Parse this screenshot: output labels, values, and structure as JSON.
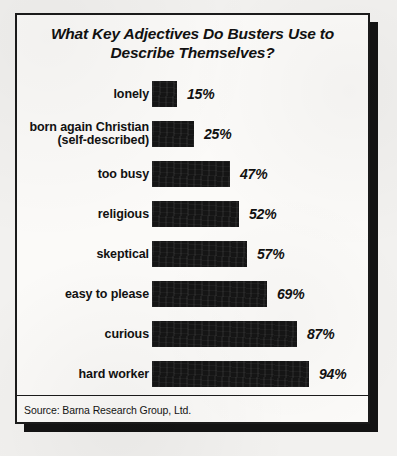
{
  "chart_data": {
    "type": "bar",
    "orientation": "horizontal",
    "title": "What Key Adjectives Do Busters Use to Describe Themselves?",
    "title_line1": "What Key Adjectives Do Busters Use to",
    "title_line2": "Describe Themselves?",
    "xlabel": "",
    "ylabel": "",
    "xlim": [
      0,
      100
    ],
    "grid": false,
    "legend": null,
    "value_suffix": "%",
    "bar_color": "#151515",
    "categories": [
      "lonely",
      "born again Christian (self-described)",
      "too busy",
      "religious",
      "skeptical",
      "easy to please",
      "curious",
      "hard worker"
    ],
    "values": [
      15,
      25,
      47,
      52,
      57,
      69,
      87,
      94
    ],
    "value_labels": [
      "15%",
      "25%",
      "47%",
      "52%",
      "57%",
      "69%",
      "87%",
      "94%"
    ],
    "bars": [
      {
        "label_line1": "lonely",
        "label_line2": "",
        "value": 15,
        "value_label": "15%"
      },
      {
        "label_line1": "born again Christian",
        "label_line2": "(self-described)",
        "value": 25,
        "value_label": "25%"
      },
      {
        "label_line1": "too busy",
        "label_line2": "",
        "value": 47,
        "value_label": "47%"
      },
      {
        "label_line1": "religious",
        "label_line2": "",
        "value": 52,
        "value_label": "52%"
      },
      {
        "label_line1": "skeptical",
        "label_line2": "",
        "value": 57,
        "value_label": "57%"
      },
      {
        "label_line1": "easy to please",
        "label_line2": "",
        "value": 69,
        "value_label": "69%"
      },
      {
        "label_line1": "curious",
        "label_line2": "",
        "value": 87,
        "value_label": "87%"
      },
      {
        "label_line1": "hard worker",
        "label_line2": "",
        "value": 94,
        "value_label": "94%"
      }
    ],
    "source": "Source: Barna Research Group, Ltd."
  }
}
